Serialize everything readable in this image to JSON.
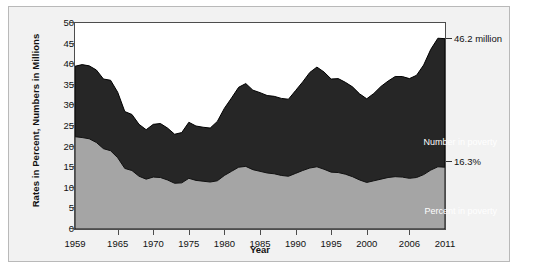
{
  "chart_data": {
    "type": "area",
    "title": "",
    "xlabel": "Year",
    "ylabel": "Rates in Percent, Numbers in Millions",
    "xlim": [
      1959,
      2011
    ],
    "ylim": [
      0,
      50
    ],
    "grid": false,
    "legend_position": "inline-annotations",
    "x_ticks": [
      "1959",
      "1965",
      "1970",
      "1975",
      "1980",
      "1985",
      "1990",
      "1995",
      "2000",
      "2006",
      "2011"
    ],
    "x_tick_values": [
      1959,
      1965,
      1970,
      1975,
      1980,
      1985,
      1990,
      1995,
      2000,
      2006,
      2011
    ],
    "y_ticks": [
      "0",
      "5",
      "10",
      "15",
      "20",
      "25",
      "30",
      "35",
      "40",
      "45",
      "50"
    ],
    "y_tick_values": [
      0,
      5,
      10,
      15,
      20,
      25,
      30,
      35,
      40,
      45,
      50
    ],
    "x": [
      1959,
      1960,
      1961,
      1962,
      1963,
      1964,
      1965,
      1966,
      1967,
      1968,
      1969,
      1970,
      1971,
      1972,
      1973,
      1974,
      1975,
      1976,
      1977,
      1978,
      1979,
      1980,
      1981,
      1982,
      1983,
      1984,
      1985,
      1986,
      1987,
      1988,
      1989,
      1990,
      1991,
      1992,
      1993,
      1994,
      1995,
      1996,
      1997,
      1998,
      1999,
      2000,
      2001,
      2002,
      2003,
      2004,
      2005,
      2006,
      2007,
      2008,
      2009,
      2010,
      2011
    ],
    "series": [
      {
        "name": "Number in poverty",
        "units": "millions",
        "color": "#262626",
        "label_color": "#ffffff",
        "values": [
          39.5,
          39.9,
          39.6,
          38.6,
          36.4,
          36.1,
          33.2,
          28.5,
          27.8,
          25.4,
          24.1,
          25.4,
          25.6,
          24.5,
          23.0,
          23.4,
          25.9,
          25.0,
          24.7,
          24.5,
          26.1,
          29.3,
          31.8,
          34.4,
          35.3,
          33.7,
          33.1,
          32.4,
          32.2,
          31.7,
          31.5,
          33.6,
          35.7,
          38.0,
          39.3,
          38.1,
          36.4,
          36.5,
          35.6,
          34.5,
          32.8,
          31.6,
          32.9,
          34.6,
          35.9,
          37.0,
          37.0,
          36.5,
          37.3,
          39.8,
          43.6,
          46.3,
          46.2
        ]
      },
      {
        "name": "Percent in poverty",
        "units": "percent",
        "color": "#a5a5a5",
        "label_color": "#ffffff",
        "values": [
          22.4,
          22.2,
          21.9,
          21.0,
          19.5,
          19.0,
          17.3,
          14.7,
          14.2,
          12.8,
          12.1,
          12.6,
          12.5,
          11.9,
          11.1,
          11.2,
          12.3,
          11.8,
          11.6,
          11.4,
          11.7,
          13.0,
          14.0,
          15.0,
          15.2,
          14.4,
          14.0,
          13.6,
          13.4,
          13.0,
          12.8,
          13.5,
          14.2,
          14.8,
          15.1,
          14.5,
          13.8,
          13.7,
          13.3,
          12.7,
          11.9,
          11.3,
          11.7,
          12.1,
          12.5,
          12.7,
          12.6,
          12.3,
          12.5,
          13.2,
          14.3,
          15.1,
          15.0
        ]
      }
    ],
    "annotations": [
      {
        "text": "46.2 million",
        "value": 46.2,
        "year": 2011,
        "series": "Number in poverty"
      },
      {
        "text": "16.3%",
        "value": 16.3,
        "year": 2011,
        "series": "Percent in poverty"
      }
    ],
    "inline_labels": [
      {
        "text": "Number in poverty",
        "series": "Number in poverty"
      },
      {
        "text": "Percent in poverty",
        "series": "Percent in poverty"
      }
    ]
  }
}
